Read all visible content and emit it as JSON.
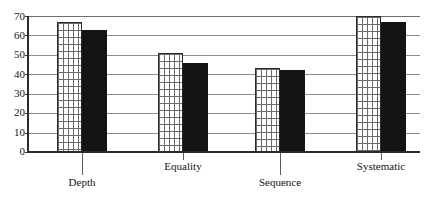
{
  "chart_data": {
    "type": "bar",
    "title": "",
    "xlabel": "",
    "ylabel": "",
    "ylim": [
      0,
      70
    ],
    "yticks": [
      0,
      10,
      20,
      30,
      40,
      50,
      60,
      70
    ],
    "grid": true,
    "legend": "none",
    "categories": [
      "Depth",
      "Equality",
      "Sequence",
      "Systematic"
    ],
    "series": [
      {
        "name": "series-1",
        "style": "hatched",
        "values": [
          67,
          51,
          43,
          70
        ]
      },
      {
        "name": "series-2",
        "style": "solid",
        "values": [
          63,
          46,
          42,
          67
        ]
      }
    ]
  },
  "axis": {
    "y_tick_labels": [
      "70",
      "60",
      "50",
      "40",
      "30",
      "20",
      "10",
      "0"
    ],
    "x_tick_labels": [
      "Depth",
      "Equality",
      "Sequence",
      "Systematic"
    ]
  },
  "colors": {
    "series_1_fill": "#ffffff",
    "series_1_hatch": "#6a6a6a",
    "series_1_border": "#2a2a2a",
    "series_2_fill": "#141414",
    "gridline": "#8d8d8d",
    "axis": "#2b2b2b",
    "text": "#141414",
    "background": "#ffffff"
  }
}
